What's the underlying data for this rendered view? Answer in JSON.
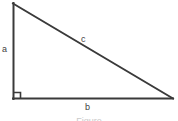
{
  "figure": {
    "kind": "right-triangle-diagram",
    "caption": "Figure",
    "background_color": "#ffffff",
    "stroke_color": "#3a3a3a",
    "label_color": "#3f3f3f",
    "stroke_width": 2,
    "canvas": {
      "width": 178,
      "height": 121
    }
  },
  "labels": {
    "leg_a": "a",
    "leg_b": "b",
    "hypotenuse_c": "c"
  },
  "geometry": {
    "apex": {
      "x": 13,
      "y": 3
    },
    "right_angle_corner": {
      "x": 13,
      "y": 99
    },
    "right_vertex": {
      "x": 173,
      "y": 99
    },
    "right_angle_marker_size": 7
  }
}
